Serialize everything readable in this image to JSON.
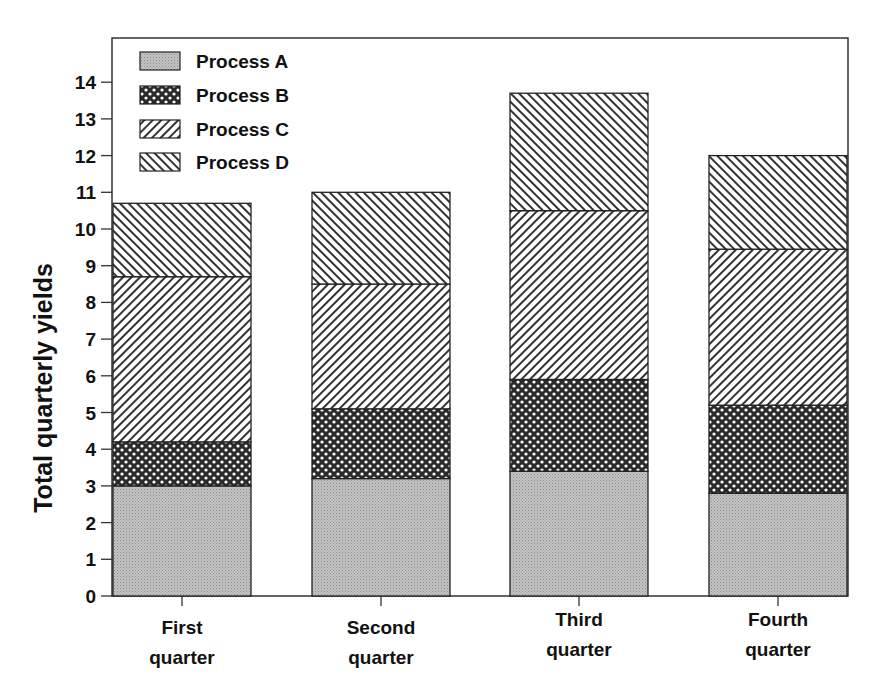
{
  "chart_data": {
    "type": "bar",
    "stacked": true,
    "title": "",
    "xlabel": "",
    "ylabel": "Total quarterly yields",
    "ylim": [
      0,
      15
    ],
    "yticks": [
      0,
      1,
      2,
      3,
      4,
      5,
      6,
      7,
      8,
      9,
      10,
      11,
      12,
      13,
      14
    ],
    "grid": false,
    "legend_position": "upper-left-inside",
    "categories": [
      [
        "First",
        "quarter"
      ],
      [
        "Second",
        "quarter"
      ],
      [
        "Third",
        "quarter"
      ],
      [
        "Fourth",
        "quarter"
      ]
    ],
    "category_labels": [
      "First quarter",
      "Second quarter",
      "Third quarter",
      "Fourth quarter"
    ],
    "series": [
      {
        "name": "Process A",
        "pattern": "dots",
        "values": [
          3.0,
          3.2,
          3.4,
          2.8
        ]
      },
      {
        "name": "Process B",
        "pattern": "crosshatch",
        "values": [
          1.2,
          1.9,
          2.5,
          2.4
        ]
      },
      {
        "name": "Process C",
        "pattern": "diag-right",
        "values": [
          4.5,
          3.4,
          4.6,
          4.25
        ]
      },
      {
        "name": "Process D",
        "pattern": "diag-left",
        "values": [
          2.0,
          2.5,
          3.2,
          2.55
        ]
      }
    ],
    "totals": [
      10.7,
      11.0,
      13.7,
      12.0
    ]
  },
  "colors": {
    "ink": "#111111",
    "background": "#ffffff",
    "processA_fill": "#b8b8b8"
  }
}
